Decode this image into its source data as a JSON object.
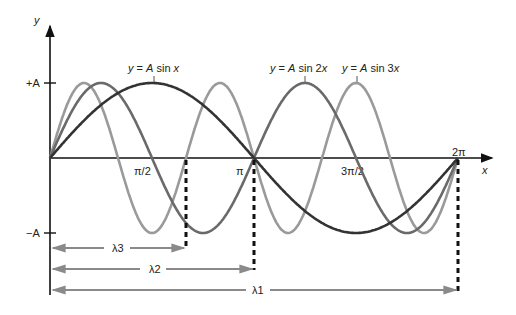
{
  "axes": {
    "y_label": "y",
    "x_label": "x",
    "y_ticks": [
      "+A",
      "−A"
    ],
    "x_ticks": [
      "π/2",
      "π",
      "3π/2",
      "2π"
    ]
  },
  "curves": [
    {
      "label": "y = A sin x",
      "harmonic": 1,
      "color": "#333333"
    },
    {
      "label": "y = A sin 2x",
      "harmonic": 2,
      "color": "#666666"
    },
    {
      "label": "y = A sin 3x",
      "harmonic": 3,
      "color": "#999999"
    }
  ],
  "wavelengths": [
    {
      "label": "λ3",
      "span": "0 to 2π/3"
    },
    {
      "label": "λ2",
      "span": "0 to π"
    },
    {
      "label": "λ1",
      "span": "0 to 2π"
    }
  ],
  "colors": {
    "axis": "#111111",
    "arrow": "#8a8a8a",
    "dash": "#111111"
  }
}
